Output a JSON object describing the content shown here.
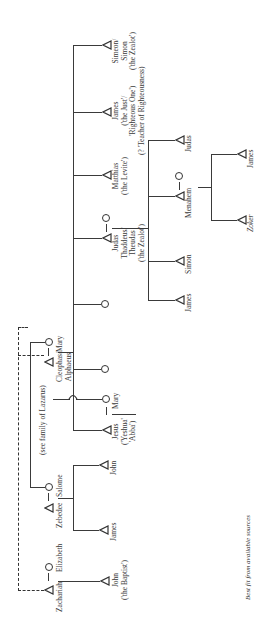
{
  "diagram": {
    "type": "family-tree",
    "orientation": "rotated-90",
    "caption": "Best fit from available sources",
    "people": {
      "zachariah": "Zachariah",
      "elizabeth": "Elizabeth",
      "john_baptist": "John\n('the Baptist')",
      "zebedee": "Zebedee",
      "salome": "Salome",
      "james_zebedee": "James",
      "john_zebedee": "John",
      "see_lazarus": "(see family of Lazarus)",
      "jesus": "Jesus\n('Yeshua'\n'Abba')",
      "mary_wife": "Mary",
      "cleophas": "Cleophas/\nAlphaeus",
      "mary_cleophas": "Mary",
      "james_son": "James",
      "simon_son": "Simon",
      "judas_thaddeus": "Judas\nThaddeus/\nTheudas\n('the Zealot')",
      "menahem": "Menahem",
      "zoker": "Zoker",
      "james_menahem": "James",
      "matthias": "Matthias\n('the Levite')",
      "judas_son": "Judas",
      "james_just": "James\n('the Just'/\n'Righteous One')\n(? 'Teacher of Righteousness)",
      "simeon": "Simeon/\nSimon\n('the Zealot')"
    },
    "symbols": {
      "male": "triangle",
      "female": "circle"
    }
  }
}
